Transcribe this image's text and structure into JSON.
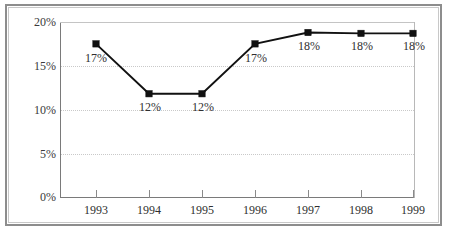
{
  "chart_data": {
    "type": "line",
    "title": "",
    "xlabel": "",
    "ylabel": "",
    "categories": [
      "1993",
      "1994",
      "1995",
      "1996",
      "1997",
      "1998",
      "1999"
    ],
    "values": [
      17,
      12,
      12,
      17,
      18,
      18,
      18
    ],
    "point_labels": [
      "17%",
      "12%",
      "12%",
      "17%",
      "18%",
      "18%",
      "18%"
    ],
    "ylim": [
      0,
      20
    ],
    "yticks": [
      0,
      5,
      10,
      15,
      20
    ],
    "ytick_labels": [
      "0%",
      "5%",
      "10%",
      "15%",
      "20%"
    ],
    "grid": true,
    "legend": "none",
    "series": [
      {
        "name": "",
        "values": [
          17,
          12,
          12,
          17,
          18,
          18,
          18
        ],
        "marker": "square",
        "color": "#111111"
      }
    ]
  },
  "colors": {
    "line": "#111111",
    "marker": "#111111",
    "grid": "#c9c9c9",
    "axis": "#7a7a7a",
    "frame": "#8d8d8d",
    "text": "#2f2f2f",
    "background": "#ffffff"
  }
}
